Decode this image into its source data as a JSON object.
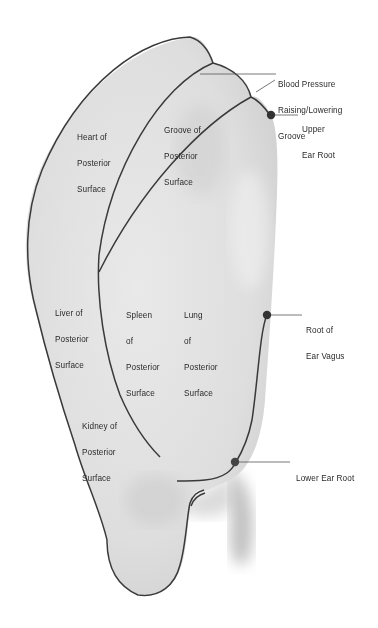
{
  "diagram": {
    "colors": {
      "outline": "#3a3a3a",
      "fill": "#dcdcdc",
      "shadow": "#a9a9a9",
      "point": "#333333",
      "text": "#2a2a2a",
      "background": "#ffffff"
    },
    "regions": [
      {
        "id": "heart",
        "lines": [
          "Heart of",
          "Posterior",
          "Surface"
        ]
      },
      {
        "id": "groove",
        "lines": [
          "Groove of",
          "Posterior",
          "Surface"
        ]
      },
      {
        "id": "liver",
        "lines": [
          "Liver of",
          "Posterior",
          "Surface"
        ]
      },
      {
        "id": "spleen",
        "lines": [
          "Spleen",
          "of",
          "Posterior",
          "Surface"
        ]
      },
      {
        "id": "lung",
        "lines": [
          "Lung",
          "of",
          "Posterior",
          "Surface"
        ]
      },
      {
        "id": "kidney",
        "lines": [
          "Kidney of",
          "Posterior",
          "Surface"
        ]
      }
    ],
    "callouts": [
      {
        "id": "bp-groove",
        "lines": [
          "Blood Pressure",
          "Raising/Lowering",
          "Groove"
        ]
      },
      {
        "id": "upper-ear-root",
        "lines": [
          "Upper",
          "Ear Root"
        ]
      },
      {
        "id": "root-ear-vagus",
        "lines": [
          "Root of",
          "Ear Vagus"
        ]
      },
      {
        "id": "lower-ear-root",
        "lines": [
          "Lower Ear Root"
        ]
      }
    ]
  }
}
